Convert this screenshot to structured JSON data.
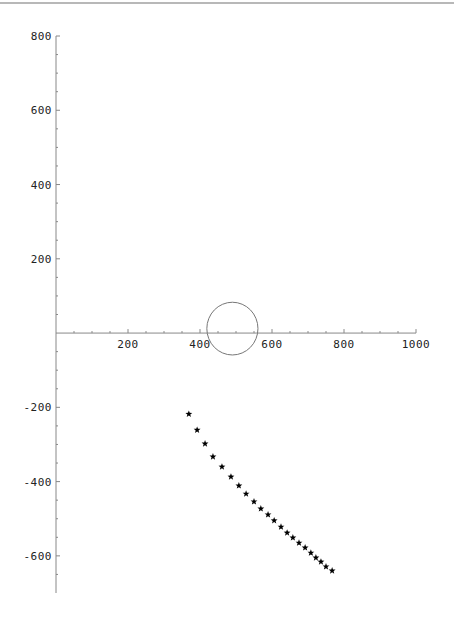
{
  "chart_data": {
    "type": "scatter",
    "title": "",
    "xlabel": "",
    "ylabel": "",
    "xlim": [
      0,
      1000
    ],
    "ylim": [
      -700,
      800
    ],
    "grid": false,
    "legend": null,
    "x_ticks": [
      200,
      400,
      600,
      800,
      1000
    ],
    "x_tick_labels": [
      "200",
      "400",
      "600",
      "800",
      "1000"
    ],
    "y_ticks": [
      -600,
      -400,
      -200,
      200,
      400,
      600,
      800
    ],
    "y_tick_labels": [
      "-600",
      "-400",
      "-200",
      "200",
      "400",
      "600",
      "800"
    ],
    "minor_tick_step": 50,
    "axis_color": "#888888",
    "shapes": [
      {
        "type": "circle",
        "cx": 490,
        "cy": 12,
        "r": 71,
        "stroke": "#777777"
      }
    ],
    "series": [
      {
        "name": "points",
        "marker": "star",
        "color": "#000000",
        "x": [
          369,
          392,
          414,
          436,
          461,
          486,
          508,
          528,
          550,
          569,
          589,
          606,
          625,
          642,
          658,
          675,
          692,
          708,
          722,
          736,
          750,
          767
        ],
        "y": [
          -218,
          -261,
          -298,
          -333,
          -360,
          -387,
          -411,
          -433,
          -454,
          -473,
          -489,
          -505,
          -522,
          -538,
          -551,
          -565,
          -578,
          -592,
          -605,
          -616,
          -629,
          -640
        ]
      }
    ]
  }
}
